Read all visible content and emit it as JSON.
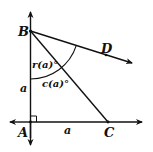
{
  "diagram": {
    "type": "geometry",
    "points": {
      "A": {
        "label": "A",
        "x": 30.5,
        "y": 122
      },
      "B": {
        "label": "B",
        "x": 30.5,
        "y": 31
      },
      "C": {
        "label": "C",
        "x": 108,
        "y": 122
      },
      "D": {
        "label": "D",
        "x": 106,
        "y": 53
      }
    },
    "side_labels": {
      "AB": "a",
      "AC": "a"
    },
    "angle_labels": {
      "r": "r(a)°",
      "c": "c(a)°"
    },
    "right_angle_at": "A",
    "colors": {
      "stroke": "#111111",
      "background": "#ffffff"
    }
  }
}
